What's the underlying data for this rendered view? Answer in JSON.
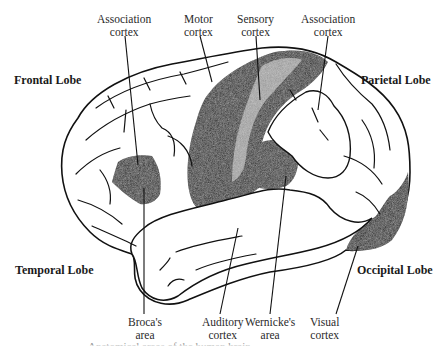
{
  "figure": {
    "caption": "Anatomical areas of the human brain",
    "colors": {
      "ink": "#111111",
      "dark_region": "#1c1c1c",
      "background": "#ffffff"
    }
  },
  "lobes": {
    "frontal": "Frontal Lobe",
    "parietal": "Parietal Lobe",
    "temporal": "Temporal Lobe",
    "occipital": "Occipital Lobe"
  },
  "labels": {
    "association_left": {
      "line1": "Association",
      "line2": "cortex"
    },
    "motor": {
      "line1": "Motor",
      "line2": "cortex"
    },
    "sensory": {
      "line1": "Sensory",
      "line2": "cortex"
    },
    "association_right": {
      "line1": "Association",
      "line2": "cortex"
    },
    "broca": {
      "line1": "Broca's",
      "line2": "area"
    },
    "auditory": {
      "line1": "Auditory",
      "line2": "cortex"
    },
    "wernicke": {
      "line1": "Wernicke's",
      "line2": "area"
    },
    "visual": {
      "line1": "Visual",
      "line2": "cortex"
    }
  }
}
